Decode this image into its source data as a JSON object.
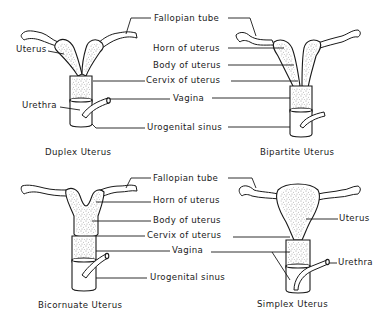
{
  "labels": {
    "fallopian_tube": "Fallopian  tube",
    "horn": "Horn of uterus",
    "body": "Body of uterus",
    "cervix": "Cervix of uterus",
    "vagina": "Vagina",
    "urogenital_sinus": "Urogenital  sinus",
    "uterus": "Uterus",
    "urethra": "Urethra"
  },
  "panels": [
    {
      "id": "duplex",
      "caption": "Duplex   Uterus",
      "side_labels": [
        "Uterus",
        "Urethra"
      ]
    },
    {
      "id": "bipartite",
      "caption": "Bipartite  Uterus",
      "side_labels": []
    },
    {
      "id": "bicornuate",
      "caption": "Bicornuate  Uterus",
      "side_labels": []
    },
    {
      "id": "simplex",
      "caption": "Simplex    Uterus",
      "side_labels": [
        "Uterus",
        "Urethra"
      ]
    }
  ],
  "colors": {
    "ink": "#1a1a1a",
    "background": "#ffffff"
  }
}
